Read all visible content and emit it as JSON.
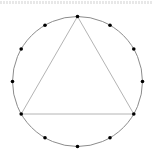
{
  "diagram": {
    "type": "inscribed-equilateral-triangle",
    "circle": {
      "cx": 77.5,
      "cy": 81.5,
      "r": 65,
      "stroke": "#8c8c8c"
    },
    "triangle": {
      "stroke": "#b4b4b4",
      "vertex_angles_deg": [
        90,
        210,
        330
      ]
    },
    "dots": {
      "count": 12,
      "angles_deg": [
        0,
        30,
        60,
        90,
        120,
        150,
        180,
        210,
        240,
        270,
        300,
        330
      ],
      "radius": 1.8,
      "fill": "#000000"
    },
    "top_text_clipped": true
  }
}
